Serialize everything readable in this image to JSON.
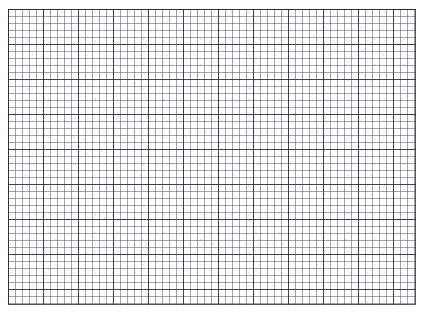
{
  "document": {
    "kind": "scanned-graph-paper",
    "width_px": 425,
    "height_px": 317,
    "background_color": "#fefefe",
    "caption": ""
  },
  "grid": {
    "name": "graph-paper-grid",
    "region": {
      "left_px": 8,
      "top_px": 9,
      "width_px": 408,
      "height_px": 296
    },
    "minor": {
      "spacing_px": 7,
      "color": "#464b55",
      "line_width_px": 1,
      "columns": 58,
      "rows": 42
    },
    "major": {
      "spacing_px": 35,
      "every_n_minor": 5,
      "color": "#282c34",
      "line_width_px": 1,
      "columns": 12,
      "rows": 9
    },
    "border_color": "#282c34"
  },
  "scan": {
    "noise_label": "speckle-texture",
    "shading_label": "edge-vignette",
    "ink_color": "#3a3f48"
  },
  "annotations": {
    "marks": [],
    "labels": [],
    "text": []
  }
}
